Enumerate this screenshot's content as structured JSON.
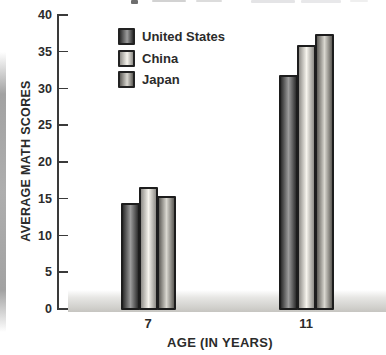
{
  "chart_data": {
    "type": "bar",
    "title": "",
    "categories": [
      "7",
      "11"
    ],
    "series": [
      {
        "name": "United States",
        "values": [
          14.5,
          32
        ],
        "edge_color": "#2e2e2e",
        "center_color": "#9c9c9c"
      },
      {
        "name": "China",
        "values": [
          16.8,
          36
        ],
        "edge_color": "#8f8d88",
        "center_color": "#f6f4ed"
      },
      {
        "name": "Japan",
        "values": [
          15.5,
          37.5
        ],
        "edge_color": "#5f5d58",
        "center_color": "#d9d7d0"
      }
    ],
    "xlabel": "AGE (IN YEARS)",
    "ylabel": "AVERAGE MATH SCORES",
    "ylim": [
      0,
      40
    ],
    "ytick_step": 5,
    "grid": false,
    "legend_position": "upper-left-inside",
    "bar_border_color": "#1d1d1d"
  },
  "colors": {
    "text": "#2b2b2b",
    "axis": "#3a3a3a",
    "floor_band": "#c8c7c2",
    "page_edge": "#a8a8a8"
  }
}
